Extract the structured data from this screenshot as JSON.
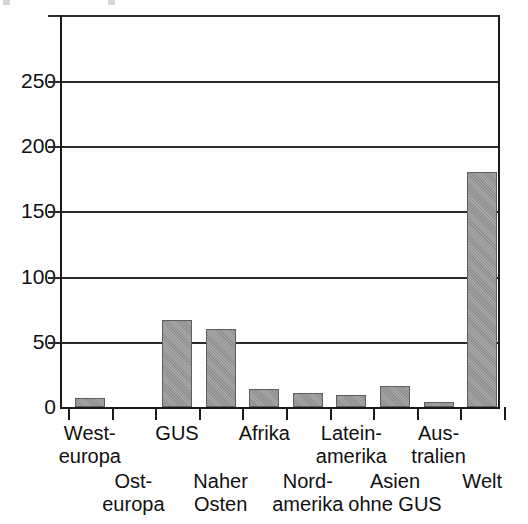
{
  "chart_data": {
    "type": "bar",
    "title": "",
    "subtitle": "",
    "xlabel": "",
    "ylabel": "",
    "ylim": [
      0,
      295
    ],
    "grid": true,
    "legend": false,
    "y_ticks": [
      0,
      50,
      100,
      150,
      200,
      250
    ],
    "y_tick_labels": [
      "0",
      "50",
      "100",
      "150",
      "200",
      "250"
    ],
    "categories": [
      "West-europa",
      "Ost-europa",
      "GUS",
      "Naher Osten",
      "Afrika",
      "Nord-amerika",
      "Latein-amerika",
      "Asien ohne GUS",
      "Australien",
      "Welt"
    ],
    "values": [
      7,
      0,
      67,
      60,
      14,
      11,
      9,
      16,
      4,
      180
    ],
    "bar_color": "#999999",
    "axis_color": "#1a1a1a"
  },
  "axis": {
    "y_ticks": [
      {
        "label": "250",
        "value": 250
      },
      {
        "label": "200",
        "value": 200
      },
      {
        "label": "150",
        "value": 150
      },
      {
        "label": "100",
        "value": 100
      },
      {
        "label": "50",
        "value": 50
      },
      {
        "label": "0",
        "value": 0
      }
    ]
  },
  "x_labels": {
    "upper_row": [
      {
        "line1": "West-",
        "line2": "europa"
      },
      {
        "line1": "GUS",
        "line2": ""
      },
      {
        "line1": "Afrika",
        "line2": ""
      },
      {
        "line1": "Latein-",
        "line2": "amerika"
      },
      {
        "line1": "Aus-",
        "line2": "tralien"
      }
    ],
    "lower_row": [
      {
        "line1": "Ost-",
        "line2": "europa"
      },
      {
        "line1": "Naher",
        "line2": "Osten"
      },
      {
        "line1": "Nord-",
        "line2": "amerika"
      },
      {
        "line1": "Asien",
        "line2": "ohne GUS"
      },
      {
        "line1": "Welt",
        "line2": ""
      }
    ]
  },
  "bars": [
    {
      "name": "West-europa",
      "value": 7
    },
    {
      "name": "Ost-europa",
      "value": 0
    },
    {
      "name": "GUS",
      "value": 67
    },
    {
      "name": "Naher Osten",
      "value": 60
    },
    {
      "name": "Afrika",
      "value": 14
    },
    {
      "name": "Nord-amerika",
      "value": 11
    },
    {
      "name": "Latein-amerika",
      "value": 9
    },
    {
      "name": "Asien ohne GUS",
      "value": 16
    },
    {
      "name": "Australien",
      "value": 4
    },
    {
      "name": "Welt",
      "value": 180
    }
  ]
}
